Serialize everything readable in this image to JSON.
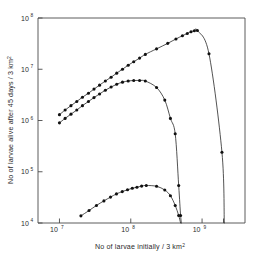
{
  "chart_data": {
    "type": "line",
    "title": "",
    "xlabel": "No of larvae initially / 3 km²",
    "ylabel": "No of larvae alive after 45 days / 3 km²",
    "xscale": "log",
    "yscale": "log",
    "xlim": [
      5000000,
      4000000000
    ],
    "ylim": [
      10000,
      100000000
    ],
    "grid": false,
    "legend": "none",
    "xticks": [
      {
        "value": 10000000,
        "label": "10",
        "exponent": "7"
      },
      {
        "value": 100000000,
        "label": "10",
        "exponent": "8"
      },
      {
        "value": 1000000000,
        "label": "10",
        "exponent": "9"
      }
    ],
    "yticks": [
      {
        "value": 10000,
        "label": "10",
        "exponent": "4"
      },
      {
        "value": 100000,
        "label": "10",
        "exponent": "5"
      },
      {
        "value": 1000000,
        "label": "10",
        "exponent": "6"
      },
      {
        "value": 10000000,
        "label": "10",
        "exponent": "7"
      },
      {
        "value": 100000000,
        "label": "10",
        "exponent": "8"
      }
    ],
    "minor_xticks": [
      2000000000
    ],
    "series": [
      {
        "name": "upper curve",
        "marker": "filled-circle",
        "points": [
          [
            10000000,
            1300000
          ],
          [
            12000000,
            1600000
          ],
          [
            14500000,
            1950000
          ],
          [
            17500000,
            2350000
          ],
          [
            21000000,
            2850000
          ],
          [
            25500000,
            3400000
          ],
          [
            30500000,
            4100000
          ],
          [
            36500000,
            4900000
          ],
          [
            44000000,
            5900000
          ],
          [
            53000000,
            7000000
          ],
          [
            63500000,
            8400000
          ],
          [
            76500000,
            10000000
          ],
          [
            92000000,
            12000000
          ],
          [
            110000000,
            14000000
          ],
          [
            133000000,
            16500000
          ],
          [
            160000000,
            19500000
          ],
          [
            230000000,
            25000000
          ],
          [
            330000000,
            32000000
          ],
          [
            430000000,
            39000000
          ],
          [
            530000000,
            45000000
          ],
          [
            620000000,
            50000000
          ],
          [
            700000000,
            54000000
          ],
          [
            780000000,
            56500000
          ],
          [
            860000000,
            57000000
          ],
          [
            1250000000,
            20000000
          ],
          [
            1900000000,
            240000
          ],
          [
            2050000000,
            10000
          ]
        ]
      },
      {
        "name": "middle curve",
        "marker": "filled-circle",
        "points": [
          [
            10000000,
            900000
          ],
          [
            12000000,
            1100000
          ],
          [
            14500000,
            1330000
          ],
          [
            17500000,
            1600000
          ],
          [
            21000000,
            1950000
          ],
          [
            25500000,
            2350000
          ],
          [
            30500000,
            2800000
          ],
          [
            36500000,
            3300000
          ],
          [
            44000000,
            3900000
          ],
          [
            53000000,
            4500000
          ],
          [
            63500000,
            5100000
          ],
          [
            76500000,
            5600000
          ],
          [
            92000000,
            5900000
          ],
          [
            110000000,
            6050000
          ],
          [
            133000000,
            6050000
          ],
          [
            160000000,
            5900000
          ],
          [
            230000000,
            4400000
          ],
          [
            300000000,
            2500000
          ],
          [
            360000000,
            1100000
          ],
          [
            420000000,
            550000
          ],
          [
            470000000,
            54000
          ],
          [
            500000000,
            14000
          ],
          [
            515000000,
            10000
          ]
        ]
      },
      {
        "name": "lower curve",
        "marker": "filled-circle",
        "points": [
          [
            20000000,
            13800
          ],
          [
            26000000,
            17500
          ],
          [
            33000000,
            22000
          ],
          [
            42000000,
            27000
          ],
          [
            52000000,
            32000
          ],
          [
            63000000,
            37000
          ],
          [
            76000000,
            41000
          ],
          [
            90000000,
            44500
          ],
          [
            105000000,
            47500
          ],
          [
            122000000,
            50000
          ],
          [
            142000000,
            52500
          ],
          [
            165000000,
            54000
          ],
          [
            230000000,
            52000
          ],
          [
            300000000,
            44000
          ],
          [
            360000000,
            34000
          ],
          [
            420000000,
            22000
          ],
          [
            470000000,
            14000
          ],
          [
            500000000,
            10000
          ]
        ]
      }
    ]
  }
}
